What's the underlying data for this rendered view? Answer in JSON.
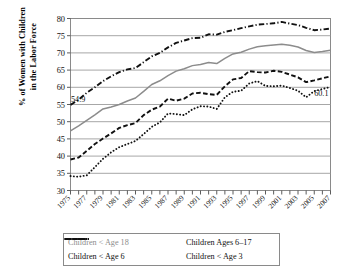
{
  "axes": {
    "ylabel_line1": "% of Women with Children",
    "ylabel_line2": "in the Labor Force",
    "yticks": [
      "80",
      "75",
      "70",
      "65",
      "60",
      "55",
      "50",
      "45",
      "40",
      "35",
      "30"
    ],
    "xticks": [
      "1975",
      "1977",
      "1979",
      "1981",
      "1983",
      "1985",
      "1987",
      "1989",
      "1991",
      "1993",
      "1995",
      "1997",
      "1999",
      "2001",
      "2003",
      "2005",
      "2007"
    ]
  },
  "annotations": [
    {
      "text": "54.9",
      "x": 1975,
      "y": 54.9
    },
    {
      "text": "60.1",
      "x": 2007,
      "y": 60.1
    }
  ],
  "legend": {
    "items": [
      {
        "label": "Children < Age 18",
        "style": "solid",
        "color": "#8c8c8c"
      },
      {
        "label": "Children Ages 6–17",
        "style": "dashdot",
        "color": "#111111"
      },
      {
        "label": "Children < Age 6",
        "style": "dashed",
        "color": "#111111"
      },
      {
        "label": "Children < Age 3",
        "style": "dotted",
        "color": "#111111"
      }
    ]
  },
  "chart_data": {
    "type": "line",
    "title": "",
    "xlabel": "",
    "ylabel": "% of Women with Children in the Labor Force",
    "xlim": [
      1975,
      2007
    ],
    "ylim": [
      30,
      80
    ],
    "ytick_step": 5,
    "grid": true,
    "legend_position": "bottom",
    "x": [
      1975,
      1976,
      1977,
      1978,
      1979,
      1980,
      1981,
      1982,
      1983,
      1984,
      1985,
      1986,
      1987,
      1988,
      1989,
      1990,
      1991,
      1992,
      1993,
      1994,
      1995,
      1996,
      1997,
      1998,
      1999,
      2000,
      2001,
      2002,
      2003,
      2004,
      2005,
      2006,
      2007
    ],
    "series": [
      {
        "name": "Children < Age 18",
        "style": "solid",
        "color": "#8c8c8c",
        "values": [
          47.3,
          48.8,
          50.4,
          52.0,
          53.7,
          54.3,
          55.0,
          56.0,
          56.9,
          58.8,
          60.8,
          61.9,
          63.4,
          64.7,
          65.4,
          66.3,
          66.6,
          67.2,
          66.9,
          68.4,
          69.7,
          70.2,
          71.1,
          71.8,
          72.1,
          72.3,
          72.5,
          72.2,
          71.7,
          70.7,
          70.1,
          70.4,
          70.8
        ]
      },
      {
        "name": "Children Ages 6–17",
        "style": "dashdot",
        "color": "#111111",
        "values": [
          54.9,
          56.4,
          58.4,
          60.0,
          61.8,
          63.2,
          64.4,
          65.2,
          65.6,
          67.3,
          69.0,
          70.0,
          71.6,
          72.9,
          73.6,
          74.3,
          74.4,
          75.4,
          75.3,
          76.1,
          76.6,
          77.2,
          77.7,
          78.2,
          78.4,
          78.6,
          79.0,
          78.5,
          78.1,
          77.3,
          76.6,
          76.8,
          77.1
        ]
      },
      {
        "name": "Children < Age 6",
        "style": "dashed",
        "color": "#111111",
        "values": [
          39.0,
          39.6,
          41.5,
          43.5,
          45.1,
          46.6,
          48.2,
          49.0,
          49.6,
          51.9,
          53.5,
          54.4,
          56.7,
          56.1,
          56.7,
          58.2,
          58.4,
          58.0,
          57.8,
          60.3,
          62.3,
          62.7,
          64.7,
          64.4,
          64.3,
          64.8,
          64.5,
          63.7,
          62.9,
          61.5,
          62.0,
          62.6,
          63.2
        ]
      },
      {
        "name": "Children < Age 3",
        "style": "dotted",
        "color": "#111111",
        "values": [
          34.2,
          34.0,
          34.4,
          36.8,
          39.2,
          41.1,
          42.6,
          43.5,
          44.4,
          46.4,
          48.5,
          49.8,
          52.4,
          52.2,
          51.9,
          53.6,
          54.5,
          54.4,
          53.7,
          57.1,
          58.7,
          59.0,
          61.1,
          61.8,
          60.4,
          60.3,
          60.5,
          59.8,
          59.0,
          57.1,
          58.9,
          59.5,
          60.1
        ]
      }
    ]
  }
}
